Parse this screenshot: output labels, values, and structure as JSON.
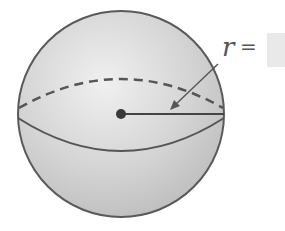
{
  "diagram": {
    "shape": "sphere",
    "radius_label": "r",
    "equals_sign": "=",
    "answer_value": "",
    "colors": {
      "fill": "#d6d6d6",
      "outline": "#555555",
      "answer_box": "#e9e9e9"
    }
  }
}
